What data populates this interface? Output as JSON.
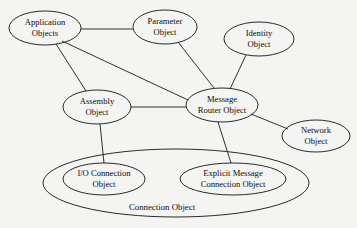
{
  "diagram": {
    "background_color": "#f4f4f2",
    "stroke_color": "#141414",
    "text_color": "#0d0d0d",
    "width": 357,
    "height": 228,
    "nodes": [
      {
        "id": "application-objects",
        "lines": [
          "Application",
          "Objects"
        ],
        "line1": "Application",
        "line2": "Objects",
        "cx": 45,
        "cy": 28,
        "rx": 36,
        "ry": 17
      },
      {
        "id": "parameter-object",
        "lines": [
          "Parameter",
          "Object"
        ],
        "line1": "Parameter",
        "line2": "Object",
        "cx": 165,
        "cy": 27,
        "rx": 32,
        "ry": 17
      },
      {
        "id": "identity-object",
        "lines": [
          "Identity",
          "Object"
        ],
        "line1": "Identity",
        "line2": "Object",
        "cx": 259,
        "cy": 39,
        "rx": 35,
        "ry": 17
      },
      {
        "id": "message-router-object",
        "lines": [
          "Message",
          "Router Object"
        ],
        "line1": "Message",
        "line2": "Router Object",
        "cx": 222,
        "cy": 105,
        "rx": 36,
        "ry": 17
      },
      {
        "id": "assembly-object",
        "lines": [
          "Assembly",
          "Object"
        ],
        "line1": "Assembly",
        "line2": "Object",
        "cx": 97,
        "cy": 107,
        "rx": 34,
        "ry": 17
      },
      {
        "id": "network-object",
        "lines": [
          "Network",
          "Object"
        ],
        "line1": "Network",
        "line2": "Object",
        "cx": 316,
        "cy": 136,
        "rx": 34,
        "ry": 16
      },
      {
        "id": "io-connection-object",
        "lines": [
          "I/O Connection",
          "Object"
        ],
        "line1": "I/O Connection",
        "line2": "Object",
        "cx": 104,
        "cy": 179,
        "rx": 41,
        "ry": 16
      },
      {
        "id": "explicit-message-connection-object",
        "lines": [
          "Explicit Message",
          "Connection Object"
        ],
        "line1": "Explicit Message",
        "line2": "Connection Object",
        "cx": 233,
        "cy": 179,
        "rx": 53,
        "ry": 16
      }
    ],
    "group": {
      "id": "connection-object",
      "label": "Connection Object",
      "cx": 176,
      "cy": 183,
      "rx": 133,
      "ry": 34,
      "label_x": 162,
      "label_y": 208
    },
    "edges": [
      {
        "id": "application-objects--parameter-object",
        "from": "application-objects",
        "to": "parameter-object",
        "x1": 81,
        "y1": 29,
        "x2": 133,
        "y2": 29
      },
      {
        "id": "application-objects--assembly-object",
        "from": "application-objects",
        "to": "assembly-object",
        "x1": 56,
        "y1": 44,
        "x2": 86,
        "y2": 91
      },
      {
        "id": "application-objects--message-router-object",
        "from": "application-objects",
        "to": "message-router-object",
        "x1": 62,
        "y1": 41,
        "x2": 188,
        "y2": 100
      },
      {
        "id": "parameter-object--message-router-object",
        "from": "parameter-object",
        "to": "message-router-object",
        "x1": 178,
        "y1": 42,
        "x2": 214,
        "y2": 88
      },
      {
        "id": "identity-object--message-router-object",
        "from": "identity-object",
        "to": "message-router-object",
        "x1": 246,
        "y1": 55,
        "x2": 230,
        "y2": 89
      },
      {
        "id": "assembly-object--message-router-object",
        "from": "assembly-object",
        "to": "message-router-object",
        "x1": 131,
        "y1": 107,
        "x2": 186,
        "y2": 107
      },
      {
        "id": "assembly-object--io-connection-object",
        "from": "assembly-object",
        "to": "io-connection-object",
        "x1": 100,
        "y1": 124,
        "x2": 104,
        "y2": 163
      },
      {
        "id": "message-router-object--explicit-message-connection-object",
        "from": "message-router-object",
        "to": "explicit-message-connection-object",
        "x1": 218,
        "y1": 122,
        "x2": 231,
        "y2": 163
      },
      {
        "id": "message-router-object--network-object",
        "from": "message-router-object",
        "to": "network-object",
        "x1": 251,
        "y1": 114,
        "x2": 288,
        "y2": 129
      }
    ]
  }
}
